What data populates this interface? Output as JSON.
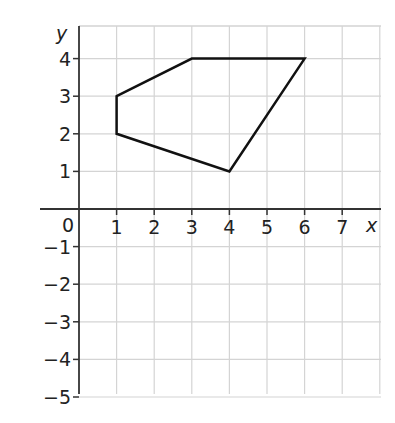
{
  "chart_data": {
    "type": "coordinate-grid",
    "title": "",
    "xlabel": "x",
    "ylabel": "y",
    "xlim": [
      0,
      8
    ],
    "ylim": [
      -5,
      5
    ],
    "x_ticks": [
      1,
      2,
      3,
      4,
      5,
      6,
      7
    ],
    "y_ticks": [
      4,
      3,
      2,
      1,
      -1,
      -2,
      -3,
      -4,
      -5
    ],
    "origin_label": "0",
    "grid": true,
    "shape": {
      "name": "pentagon",
      "vertices": [
        [
          1,
          3
        ],
        [
          3,
          4
        ],
        [
          6,
          4
        ],
        [
          4,
          1
        ],
        [
          1,
          2
        ]
      ]
    }
  },
  "labels": {
    "x_axis": "x",
    "y_axis": "y",
    "origin": "0",
    "x_ticks": [
      "1",
      "2",
      "3",
      "4",
      "5",
      "6",
      "7"
    ],
    "y_ticks": [
      "4",
      "3",
      "2",
      "1",
      "−1",
      "−2",
      "−3",
      "−4",
      "−5"
    ]
  },
  "colors": {
    "grid": "#d4d4d4",
    "axis": "#333333",
    "shape": "#111111"
  }
}
